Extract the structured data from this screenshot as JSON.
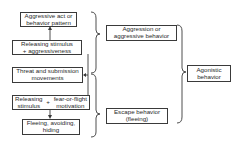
{
  "diagram": {
    "left_column": {
      "aggressive_act": [
        "Aggressive act or",
        "behavior pattern"
      ],
      "releasing_aggr": [
        "Releasing stimulus",
        "+  aggressiveness"
      ],
      "threat_submission": [
        "Threat and submission",
        "movements"
      ],
      "releasing_fear": {
        "left": [
          "Releasing",
          "stimulus"
        ],
        "plus": "+",
        "right": [
          "fear-or-flight",
          "motivation"
        ]
      },
      "fleeing": [
        "Fleeing, avoiding,",
        "hiding"
      ]
    },
    "middle_column": {
      "aggression": [
        "Aggression or",
        "aggressive behavior"
      ],
      "escape": [
        "Escape behavior",
        "(fleeing)"
      ]
    },
    "right_column": {
      "agonistic": [
        "Agonistic",
        "behavior"
      ]
    },
    "line_color": "#3a3a3a"
  }
}
